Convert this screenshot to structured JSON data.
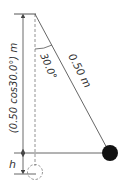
{
  "diagram": {
    "type": "pendulum-geometry",
    "labels": {
      "vertical_length": "(0.50 cos30.0°) m",
      "angle": "30.0°",
      "string_length": "0.50 m",
      "height": "h"
    },
    "colors": {
      "line": "#555555",
      "bob": "#111111",
      "dashed": "#777777"
    }
  }
}
